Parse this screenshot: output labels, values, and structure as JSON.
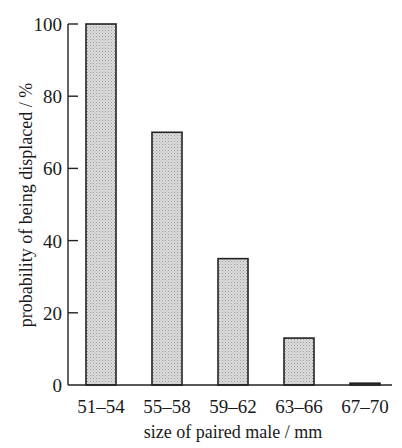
{
  "chart_data": {
    "type": "bar",
    "title": "",
    "xlabel": "size of paired male / mm",
    "ylabel": "probability of being displaced / %",
    "categories": [
      "51–54",
      "55–58",
      "59–62",
      "63–66",
      "67–70"
    ],
    "values": [
      100,
      70,
      35,
      13,
      0.5
    ],
    "ylim": [
      0,
      100
    ],
    "yticks": [
      0,
      20,
      40,
      60,
      80,
      100
    ],
    "grid": false,
    "legend": null,
    "bar_fill": "#d4d4d4",
    "bar_edge": "#222222"
  },
  "axes": {
    "y_tick_labels": [
      "0",
      "20",
      "40",
      "60",
      "80",
      "100"
    ],
    "x_tick_labels": [
      "51–54",
      "55–58",
      "59–62",
      "63–66",
      "67–70"
    ],
    "xlabel": "size of paired male / mm",
    "ylabel": "probability of being displaced / %"
  }
}
